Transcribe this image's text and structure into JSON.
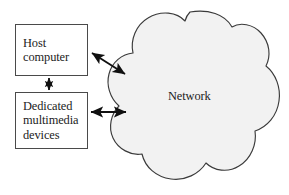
{
  "diagram": {
    "background_color": "#ffffff",
    "line_color": "#4a4a4a",
    "text_color": "#1c1c1c",
    "cloud_fill_color": "#f2f2f2",
    "nodes": [
      {
        "id": "host-computer",
        "label": "Host\ncomputer",
        "shape": "rectangle"
      },
      {
        "id": "dedicated-devices",
        "label": "Dedicated\nmultimedia\ndevices",
        "shape": "rectangle"
      },
      {
        "id": "network",
        "label": "Network",
        "shape": "cloud"
      }
    ],
    "connectors": [
      {
        "id": "host-to-devices",
        "from": "host-computer",
        "to": "dedicated-devices",
        "style": "double-arrow",
        "orientation": "vertical"
      },
      {
        "id": "host-to-network",
        "from": "host-computer",
        "to": "network",
        "style": "double-arrow",
        "orientation": "diagonal"
      },
      {
        "id": "devices-to-network",
        "from": "dedicated-devices",
        "to": "network",
        "style": "double-arrow",
        "orientation": "horizontal"
      }
    ]
  }
}
